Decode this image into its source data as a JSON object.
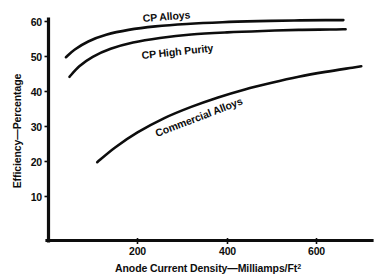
{
  "chart_data": {
    "type": "line",
    "title": "",
    "xlabel": "Anode Current Density—Milliamps/Ft²",
    "ylabel": "Efficiency—Percentage",
    "xlim": [
      0,
      740
    ],
    "ylim": [
      0,
      63
    ],
    "grid": false,
    "legend_position": "inline-curve-labels",
    "x_ticks": [
      200,
      400,
      600
    ],
    "x_tick_labels": [
      "200",
      "400",
      "600"
    ],
    "y_ticks": [
      10,
      20,
      30,
      40,
      50,
      60
    ],
    "y_tick_labels": [
      "10",
      "20",
      "30",
      "40",
      "50",
      "60"
    ],
    "series": [
      {
        "name": "CP Alloys",
        "label_text": "CP Alloys",
        "x": [
          40,
          60,
          90,
          130,
          180,
          240,
          310,
          390,
          470,
          550,
          620,
          660
        ],
        "values": [
          49.8,
          52.0,
          54.3,
          56.2,
          57.6,
          58.6,
          59.3,
          59.8,
          60.1,
          60.3,
          60.4,
          60.4
        ]
      },
      {
        "name": "CP High Purity",
        "label_text": "CP High Purity",
        "x": [
          48,
          70,
          100,
          140,
          190,
          250,
          320,
          400,
          480,
          560,
          630,
          665
        ],
        "values": [
          44.2,
          47.2,
          49.9,
          52.2,
          54.0,
          55.3,
          56.3,
          56.9,
          57.3,
          57.6,
          57.7,
          57.8
        ]
      },
      {
        "name": "Commercial Alloys",
        "label_text": "Commercial Alloys",
        "x": [
          110,
          150,
          200,
          260,
          320,
          380,
          440,
          500,
          560,
          620,
          680,
          700
        ],
        "values": [
          19.8,
          24.0,
          28.3,
          32.4,
          35.6,
          38.3,
          40.6,
          42.5,
          44.2,
          45.6,
          46.8,
          47.2
        ]
      }
    ]
  },
  "axes": {
    "y_title": "Efficiency—Percentage",
    "x_title_main": "Anode Current Density—Milliamps/Ft",
    "x_title_superscript": "2"
  },
  "series_labels": {
    "cp_alloys": "CP Alloys",
    "cp_high_purity": "CP High Purity",
    "commercial_alloys": "Commercial Alloys"
  },
  "ticks": {
    "y": [
      "60",
      "50",
      "40",
      "30",
      "20",
      "10"
    ],
    "x": [
      "200",
      "400",
      "600"
    ]
  },
  "colors": {
    "ink": "#0d0d0d",
    "background": "#ffffff"
  }
}
